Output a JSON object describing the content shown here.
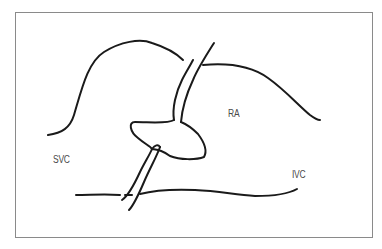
{
  "diagram": {
    "type": "anatomical-schematic",
    "labels": {
      "svc": "SVC",
      "ra": "RA",
      "ivc": "IVC"
    },
    "colors": {
      "stroke": "#1a1a1a",
      "frame": "#8a8a8a",
      "label": "#4a4a4a",
      "background": "#ffffff"
    }
  }
}
